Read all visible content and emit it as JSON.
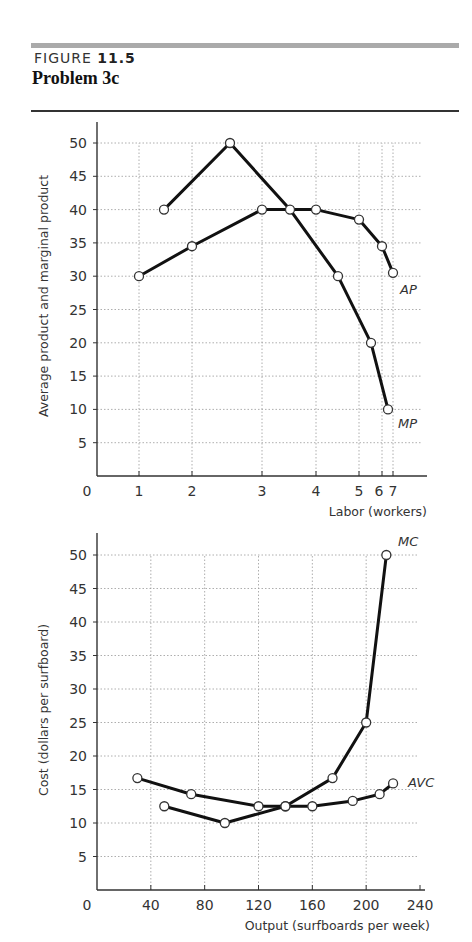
{
  "header": {
    "figure_prefix": "FIGURE",
    "figure_number": "11.5",
    "title": "Problem 3c"
  },
  "chart_data": [
    {
      "type": "line",
      "title": "Average product and marginal product",
      "xlabel": "Labor (workers)",
      "ylabel": "Average product and marginal product",
      "x_ticks": [
        {
          "label": "1",
          "px": 139
        },
        {
          "label": "2",
          "px": 192
        },
        {
          "label": "3",
          "px": 262
        },
        {
          "label": "4",
          "px": 316
        },
        {
          "label": "5",
          "px": 359
        },
        {
          "label": "6",
          "px": 382
        },
        {
          "label": "7",
          "px": 393
        }
      ],
      "y_ticks": [
        5,
        10,
        15,
        20,
        25,
        30,
        35,
        40,
        45,
        50
      ],
      "ylim": [
        0,
        50
      ],
      "grid": true,
      "origin_label": "0",
      "series": [
        {
          "name": "AP",
          "points": [
            {
              "x": 1,
              "y": 30
            },
            {
              "x": 2,
              "y": 34.5
            },
            {
              "x": 3,
              "y": 40
            },
            {
              "x": 4,
              "y": 40
            },
            {
              "x": 5,
              "y": 38.5
            },
            {
              "x": 6,
              "y": 34.5
            },
            {
              "x": 7,
              "y": 30.5
            }
          ],
          "px_x": [
            139,
            192,
            262,
            316,
            359,
            382,
            393
          ]
        },
        {
          "name": "MP",
          "points": [
            {
              "x": 1.5,
              "y": 40
            },
            {
              "x": 2.5,
              "y": 50
            },
            {
              "x": 3.5,
              "y": 40
            },
            {
              "x": 4.5,
              "y": 30
            },
            {
              "x": 5.5,
              "y": 20
            },
            {
              "x": 6.5,
              "y": 10
            }
          ],
          "px_x": [
            164,
            230,
            290,
            338,
            371,
            388
          ]
        }
      ]
    },
    {
      "type": "line",
      "title": "Cost curves",
      "xlabel": "Output (surfboards per week)",
      "ylabel": "Cost (dollars per surfboard)",
      "x_ticks": [
        40,
        80,
        120,
        160,
        200,
        240
      ],
      "xlim": [
        0,
        240
      ],
      "y_ticks": [
        5,
        10,
        15,
        20,
        25,
        30,
        35,
        40,
        45,
        50
      ],
      "ylim": [
        0,
        50
      ],
      "grid": true,
      "origin_label": "0",
      "series": [
        {
          "name": "AVC",
          "points": [
            {
              "x": 30,
              "y": 16.7
            },
            {
              "x": 70,
              "y": 14.3
            },
            {
              "x": 120,
              "y": 12.5
            },
            {
              "x": 140,
              "y": 12.5
            },
            {
              "x": 160,
              "y": 12.5
            },
            {
              "x": 190,
              "y": 13.3
            },
            {
              "x": 210,
              "y": 14.3
            },
            {
              "x": 220,
              "y": 15.9
            }
          ]
        },
        {
          "name": "MC",
          "points": [
            {
              "x": 50,
              "y": 12.5
            },
            {
              "x": 95,
              "y": 10
            },
            {
              "x": 140,
              "y": 12.5
            },
            {
              "x": 175,
              "y": 16.7
            },
            {
              "x": 200,
              "y": 25
            },
            {
              "x": 215,
              "y": 50
            }
          ]
        }
      ]
    }
  ]
}
